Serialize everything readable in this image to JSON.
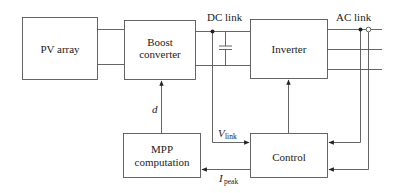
{
  "blocks": {
    "pv_array": "PV array",
    "boost_line1": "Boost",
    "boost_line2": "converter",
    "inverter": "Inverter",
    "mpp_line1": "MPP",
    "mpp_line2": "computation",
    "control": "Control"
  },
  "labels": {
    "dc_link": "DC link",
    "ac_link": "AC link",
    "d": "d",
    "v_main": "V",
    "v_sub": "link",
    "i_main": "I",
    "i_sub": "peak"
  },
  "colors": {
    "stroke": "#555555",
    "text": "#222222"
  }
}
